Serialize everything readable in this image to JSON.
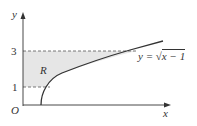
{
  "diagram": {
    "axes": {
      "x_label": "x",
      "y_label": "y",
      "origin_label": "O"
    },
    "y_ticks": [
      "1",
      "3"
    ],
    "region_label": "R",
    "curve_label": "y = √x − 1",
    "curve_label_parts": {
      "lhs": "y =",
      "sqrt": "√",
      "radicand": "x − 1"
    },
    "colors": {
      "region_fill": "#e6e6e6",
      "curve": "#333333",
      "dashed": "#555555",
      "axis": "#333333"
    }
  }
}
